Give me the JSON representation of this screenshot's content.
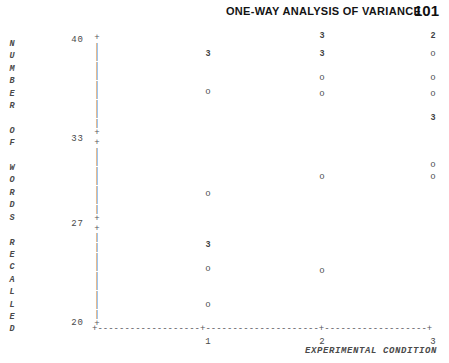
{
  "header": {
    "title": "ONE-WAY ANALYSIS OF VARIANCE",
    "page_number": "101"
  },
  "chart_data": {
    "type": "scatter",
    "title": "",
    "xlabel": "EXPERIMENTAL CONDITION",
    "ylabel": "NUMBER OF WORDS RECALLED",
    "ylabel_letters": "N\nU\nM\nB\nE\nR\n \nO\nF\n \nW\nO\nR\nD\nS\n \nR\nE\nC\nA\nL\nL\nE\nD",
    "xlim": [
      0.5,
      3.5
    ],
    "ylim": [
      20,
      40
    ],
    "xticks": [
      "1",
      "2",
      "3"
    ],
    "yticks": [
      "40",
      "33",
      "27",
      "20"
    ],
    "grid": false,
    "legend": null,
    "marker_single": "o",
    "note": "digit markers denote number of coincident observations at that point",
    "series": [
      {
        "name": "1",
        "x": 1,
        "points": [
          {
            "y": 39,
            "label": "3",
            "count": 3
          },
          {
            "y": 36.3,
            "label": "o",
            "count": 1
          },
          {
            "y": 29.1,
            "label": "o",
            "count": 1
          },
          {
            "y": 25.5,
            "label": "3",
            "count": 3
          },
          {
            "y": 23.8,
            "label": "o",
            "count": 1
          },
          {
            "y": 21.3,
            "label": "o",
            "count": 1
          }
        ]
      },
      {
        "name": "2",
        "x": 2,
        "points": [
          {
            "y": 40.3,
            "label": "3",
            "count": 3
          },
          {
            "y": 39,
            "label": "3",
            "count": 3
          },
          {
            "y": 37.3,
            "label": "o",
            "count": 1
          },
          {
            "y": 36.2,
            "label": "o",
            "count": 1
          },
          {
            "y": 30.3,
            "label": "o",
            "count": 1
          },
          {
            "y": 23.7,
            "label": "o",
            "count": 1
          }
        ]
      },
      {
        "name": "3",
        "x": 3,
        "points": [
          {
            "y": 40.3,
            "label": "2",
            "count": 2
          },
          {
            "y": 39,
            "label": "o",
            "count": 1
          },
          {
            "y": 37.3,
            "label": "o",
            "count": 1
          },
          {
            "y": 36.2,
            "label": "o",
            "count": 1
          },
          {
            "y": 34.5,
            "label": "3",
            "count": 3
          },
          {
            "y": 31.2,
            "label": "o",
            "count": 1
          },
          {
            "y": 30.3,
            "label": "o",
            "count": 1
          }
        ]
      }
    ]
  }
}
